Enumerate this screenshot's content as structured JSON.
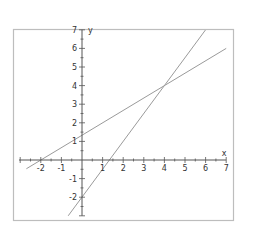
{
  "chart_data": {
    "type": "line",
    "title": "",
    "xlabel": "x",
    "ylabel": "y",
    "xlim": [
      -2.7,
      7
    ],
    "ylim": [
      -3,
      7
    ],
    "grid": false,
    "legend": null,
    "x_ticks": [
      -2,
      -1,
      1,
      2,
      3,
      4,
      5,
      6,
      7
    ],
    "y_ticks": [
      -2,
      -1,
      1,
      2,
      3,
      4,
      5,
      6,
      7
    ],
    "series": [
      {
        "name": "line-1",
        "equation": "y = (2/3)x + 4/3",
        "x": [
          -2.7,
          7
        ],
        "y": [
          -0.47,
          6.0
        ]
      },
      {
        "name": "line-2",
        "equation": "y = 1.5x - 2",
        "x": [
          -0.67,
          6
        ],
        "y": [
          -3,
          7
        ]
      }
    ],
    "annotations": [
      {
        "label": "intersection",
        "x": 4,
        "y": 4
      }
    ]
  },
  "colors": {
    "frame": "#bdbdbd",
    "axis": "#555555",
    "line": "#9a9a9a",
    "text": "#333333"
  }
}
